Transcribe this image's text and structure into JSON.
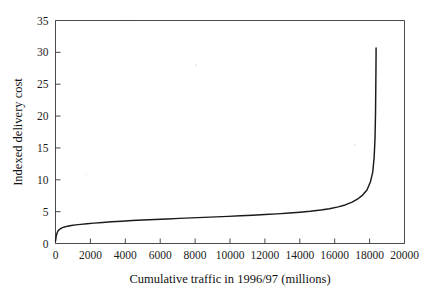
{
  "figure": {
    "background_color": "#ffffff",
    "line_color": "#1a1a1a",
    "axis_color": "#4a4a4a"
  },
  "chart_data": {
    "type": "line",
    "title": "",
    "xlabel": "Cumulative traffic in 1996/97 (millions)",
    "ylabel": "Indexed delivery cost",
    "xlim": [
      0,
      20000
    ],
    "ylim": [
      0,
      35
    ],
    "xticks": [
      0,
      2000,
      4000,
      6000,
      8000,
      10000,
      12000,
      14000,
      16000,
      18000,
      20000
    ],
    "yticks": [
      0,
      5,
      10,
      15,
      20,
      25,
      30,
      35
    ],
    "xtick_labels": [
      "0",
      "2000",
      "4000",
      "6000",
      "8000",
      "10000",
      "12000",
      "14000",
      "16000",
      "18000",
      "20000"
    ],
    "ytick_labels": [
      "0",
      "5",
      "10",
      "15",
      "20",
      "25",
      "30",
      "35"
    ],
    "grid": false,
    "legend": null,
    "series": [
      {
        "name": "Indexed delivery cost",
        "x": [
          0,
          40,
          90,
          150,
          220,
          300,
          400,
          520,
          700,
          900,
          1150,
          1450,
          1800,
          2200,
          2700,
          3200,
          3800,
          4400,
          5000,
          5700,
          6400,
          7100,
          7800,
          8500,
          9200,
          9900,
          10600,
          11300,
          12000,
          12700,
          13400,
          14000,
          14600,
          15200,
          15700,
          16200,
          16600,
          17000,
          17300,
          17600,
          17850,
          18050,
          18180,
          18260,
          18310,
          18340,
          18355,
          18365,
          18370,
          18372
        ],
        "y": [
          0.35,
          1.15,
          1.65,
          2.0,
          2.2,
          2.35,
          2.5,
          2.6,
          2.72,
          2.82,
          2.92,
          3.0,
          3.1,
          3.2,
          3.3,
          3.4,
          3.5,
          3.6,
          3.68,
          3.78,
          3.86,
          3.94,
          4.02,
          4.1,
          4.18,
          4.26,
          4.35,
          4.44,
          4.54,
          4.65,
          4.78,
          4.9,
          5.05,
          5.25,
          5.45,
          5.75,
          6.05,
          6.5,
          6.95,
          7.6,
          8.4,
          9.7,
          11.2,
          13.5,
          16.5,
          20.5,
          24.5,
          27.5,
          29.5,
          30.7
        ]
      }
    ]
  }
}
